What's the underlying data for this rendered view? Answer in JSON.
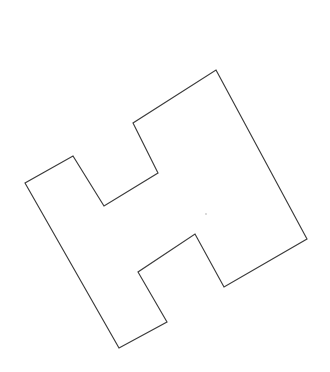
{
  "canvas": {
    "width": 330,
    "height": 372,
    "background_color": "#ffffff",
    "title": "Rotated H-shaped polygon outline"
  },
  "shape": {
    "name": "rotated-h-polygon",
    "kind": "polygon",
    "vertex_count": 12,
    "fill_color": "#ffffff",
    "stroke_color": "#3b3b3b",
    "stroke_width": 1.15,
    "points": "216,70 307,239 224,287 195,234 138,272 167,322 119,348 25,183 73,156 104,206 158,173 133,123",
    "vertices": [
      {
        "index": 0,
        "x": 216,
        "y": 70,
        "label": "top-apex"
      },
      {
        "index": 1,
        "x": 307,
        "y": 239,
        "label": "right-apex"
      },
      {
        "index": 2,
        "x": 224,
        "y": 287,
        "label": "lower-right-inner"
      },
      {
        "index": 3,
        "x": 195,
        "y": 234,
        "label": "right-notch-apex"
      },
      {
        "index": 4,
        "x": 138,
        "y": 272,
        "label": "lower-notch-left"
      },
      {
        "index": 5,
        "x": 167,
        "y": 322,
        "label": "lower-notch-bottom"
      },
      {
        "index": 6,
        "x": 119,
        "y": 348,
        "label": "bottom-apex"
      },
      {
        "index": 7,
        "x": 25,
        "y": 183,
        "label": "left-apex"
      },
      {
        "index": 8,
        "x": 73,
        "y": 156,
        "label": "upper-left-outer"
      },
      {
        "index": 9,
        "x": 104,
        "y": 206,
        "label": "upper-notch-bottom"
      },
      {
        "index": 10,
        "x": 158,
        "y": 173,
        "label": "upper-notch-right"
      },
      {
        "index": 11,
        "x": 133,
        "y": 123,
        "label": "upper-left-inner"
      }
    ]
  },
  "interior_mark": {
    "name": "faint-interior-dot",
    "x": 206,
    "y": 214,
    "radius": 0.9,
    "color": "#c9c9c9"
  }
}
